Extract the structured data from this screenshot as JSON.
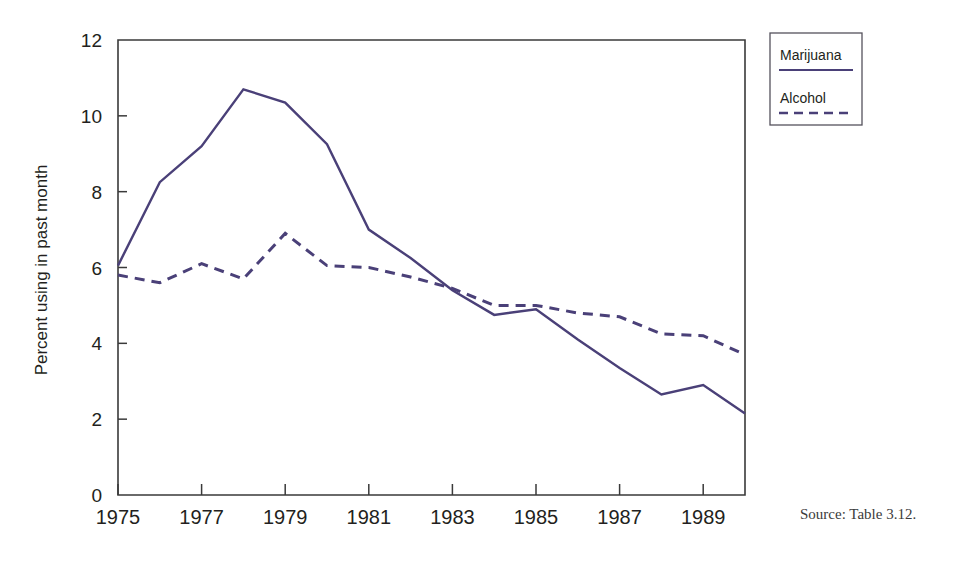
{
  "chart_data": {
    "type": "line",
    "title": "",
    "subtitle": "",
    "xlabel": "",
    "ylabel": "Percent using in past month",
    "x": [
      1975,
      1976,
      1977,
      1978,
      1979,
      1980,
      1981,
      1982,
      1983,
      1984,
      1985,
      1986,
      1987,
      1988,
      1989,
      1990
    ],
    "xlim": [
      1975,
      1990
    ],
    "ylim": [
      0,
      12
    ],
    "xtick_labels": [
      "1975",
      "1977",
      "1979",
      "1981",
      "1983",
      "1985",
      "1987",
      "1989"
    ],
    "xtick_values": [
      1975,
      1977,
      1979,
      1981,
      1983,
      1985,
      1987,
      1989
    ],
    "ytick_labels": [
      "0",
      "2",
      "4",
      "6",
      "8",
      "10",
      "12"
    ],
    "ytick_values": [
      0,
      2,
      4,
      6,
      8,
      10,
      12
    ],
    "grid": false,
    "legend_position": "outside-top-right",
    "series": [
      {
        "name": "Marijuana",
        "style": "solid",
        "color": "#4a4078",
        "values": [
          6.05,
          8.25,
          9.2,
          10.7,
          10.35,
          9.25,
          7.0,
          6.25,
          5.4,
          4.75,
          4.9,
          4.1,
          3.35,
          2.65,
          2.9,
          2.15
        ]
      },
      {
        "name": "Alcohol",
        "style": "dashed",
        "color": "#4a4078",
        "values": [
          5.8,
          5.6,
          6.1,
          5.7,
          6.9,
          6.05,
          6.0,
          5.75,
          5.45,
          5.0,
          5.0,
          4.8,
          4.7,
          4.25,
          4.2,
          3.7
        ]
      }
    ],
    "annotations": {
      "source": "Source: Table 3.12."
    }
  },
  "legend": {
    "entries": [
      {
        "label": "Marijuana",
        "style": "solid"
      },
      {
        "label": "Alcohol",
        "style": "dashed"
      }
    ]
  },
  "colors": {
    "series": "#4a4078",
    "axis": "#3a3a3a",
    "text": "#231f20",
    "background": "#ffffff"
  }
}
